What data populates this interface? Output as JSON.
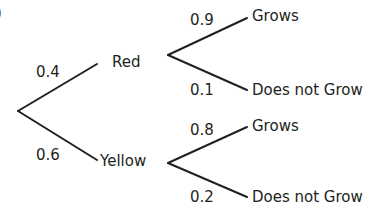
{
  "diagram": {
    "type": "probability-tree",
    "corner_mark": ")",
    "first_stage": [
      {
        "outcome": "Red",
        "probability": "0.4"
      },
      {
        "outcome": "Yellow",
        "probability": "0.6"
      }
    ],
    "second_stage": {
      "red": [
        {
          "outcome": "Grows",
          "probability": "0.9"
        },
        {
          "outcome": "Does not Grow",
          "probability": "0.1"
        }
      ],
      "yellow": [
        {
          "outcome": "Grows",
          "probability": "0.8"
        },
        {
          "outcome": "Does not Grow",
          "probability": "0.2"
        }
      ]
    },
    "line_color": "#231f20",
    "text_color": "#231f20"
  }
}
